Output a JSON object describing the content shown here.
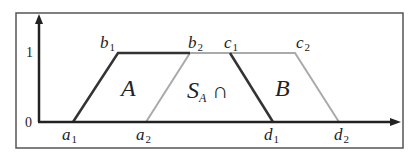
{
  "figure": {
    "y_ticks": {
      "zero": "0",
      "one": "1"
    },
    "point_labels": {
      "a1": {
        "base": "a",
        "sub": "1"
      },
      "a2": {
        "base": "a",
        "sub": "2"
      },
      "b1": {
        "base": "b",
        "sub": "1"
      },
      "b2": {
        "base": "b",
        "sub": "2"
      },
      "c1": {
        "base": "c",
        "sub": "1"
      },
      "c2": {
        "base": "c",
        "sub": "2"
      },
      "d1": {
        "base": "d",
        "sub": "1"
      },
      "d2": {
        "base": "d",
        "sub": "2"
      }
    },
    "region_labels": {
      "A": "A",
      "B": "B",
      "intersection_base": "S",
      "intersection_sub": "A",
      "intersection_symbol": "∩"
    },
    "colors": {
      "trapezoid_a": "#333333",
      "trapezoid_b": "#aaaaaa",
      "axes": "#222222",
      "frame": "#555555"
    }
  }
}
